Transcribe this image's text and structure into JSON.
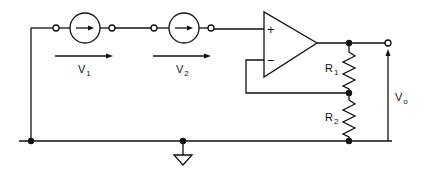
{
  "diagram": {
    "type": "circuit",
    "colors": {
      "stroke": "#111111",
      "background": "#ffffff"
    },
    "labels": {
      "v1": {
        "main": "V",
        "sub": "1"
      },
      "v2": {
        "main": "V",
        "sub": "2"
      },
      "r1": {
        "main": "R",
        "sub": "1"
      },
      "r2": {
        "main": "R",
        "sub": "2"
      },
      "vo": {
        "main": "V",
        "sub": "o"
      },
      "plus": "+",
      "minus": "−"
    },
    "components": [
      {
        "id": "source-1",
        "kind": "current/voltage source (circle with arrow)"
      },
      {
        "id": "source-2",
        "kind": "current/voltage source (circle with arrow)"
      },
      {
        "id": "op-amp",
        "kind": "operational amplifier"
      },
      {
        "id": "r1",
        "kind": "resistor"
      },
      {
        "id": "r2",
        "kind": "resistor"
      },
      {
        "id": "ground",
        "kind": "ground symbol"
      }
    ]
  }
}
